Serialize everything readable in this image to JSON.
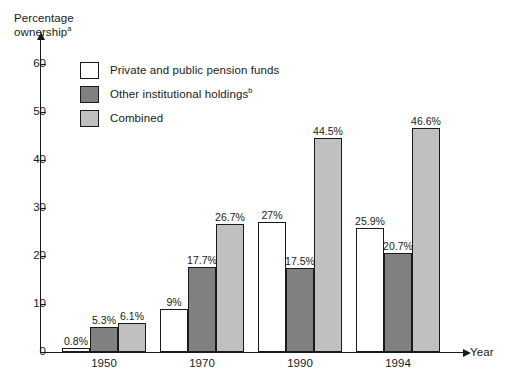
{
  "chart_data": {
    "type": "bar",
    "title": "",
    "xlabel": "Year",
    "ylabel": "Percentage ownership",
    "ylabel_superscript": "a",
    "categories": [
      "1950",
      "1970",
      "1990",
      "1994"
    ],
    "ylim": [
      0,
      65
    ],
    "yticks": [
      0,
      10,
      20,
      30,
      40,
      50,
      60
    ],
    "ytick_labels": [
      "0",
      "10",
      "20",
      "30",
      "40",
      "50",
      "60"
    ],
    "grid": false,
    "legend_position": "upper-left-inside",
    "series": [
      {
        "name": "Private and public pension funds",
        "color": "#ffffff",
        "values": [
          0.8,
          9,
          27,
          25.9
        ],
        "labels": [
          "0.8%",
          "9%",
          "27%",
          "25.9%"
        ]
      },
      {
        "name": "Other institutional holdings",
        "name_superscript": "b",
        "color": "#808080",
        "values": [
          5.3,
          17.7,
          17.5,
          20.7
        ],
        "labels": [
          "5.3%",
          "17.7%",
          "17.5%",
          "20.7%"
        ]
      },
      {
        "name": "Combined",
        "color": "#c0c0c0",
        "values": [
          6.1,
          26.7,
          44.5,
          46.6
        ],
        "labels": [
          "6.1%",
          "26.7%",
          "44.5%",
          "46.6%"
        ]
      }
    ]
  },
  "axes": {
    "y_title_line1": "Percentage",
    "y_title_line2": "ownership",
    "y_title_sup": "a",
    "x_title": "Year"
  },
  "legend": {
    "items": [
      {
        "label": "Private and public pension funds",
        "sup": "",
        "swatch": "white-swatch"
      },
      {
        "label": "Other institutional holdings",
        "sup": "b",
        "swatch": "dark-gray-swatch"
      },
      {
        "label": "Combined",
        "sup": "",
        "swatch": "light-gray-swatch"
      }
    ]
  },
  "colors": {
    "series_1": "#ffffff",
    "series_2": "#808080",
    "series_3": "#c0c0c0",
    "axis": "#1a1a1a",
    "background": "#ffffff"
  }
}
